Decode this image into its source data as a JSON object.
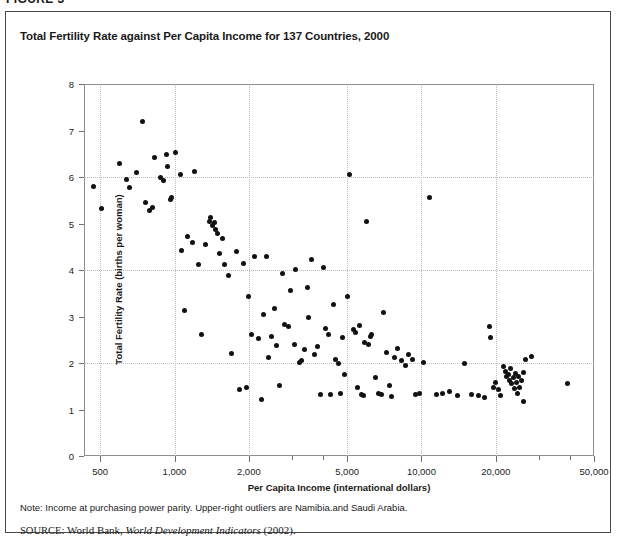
{
  "figure": {
    "label": "FIGURE 3",
    "title": "Total Fertility Rate against Per Capita Income for 137 Countries, 2000",
    "note": "Note: Income at purchasing power parity. Upper-right outliers are Namibia.and Saudi Arabia.",
    "source_keyword": "SOURCE:",
    "source_text": "World Bank,",
    "source_italic": "World Development Indicators",
    "source_year": "(2002)."
  },
  "chart_data": {
    "type": "scatter",
    "title": "Total Fertility Rate against Per Capita Income for 137 Countries, 2000",
    "xlabel": "Per Capita Income (international dollars)",
    "ylabel": "Total Fertility Rate (births per woman)",
    "xscale": "log",
    "xlim": [
      430,
      50000
    ],
    "ylim": [
      0,
      8
    ],
    "grid": true,
    "legend": null,
    "xticks": [
      500,
      1000,
      2000,
      5000,
      10000,
      20000,
      50000
    ],
    "xticklabels": [
      "500",
      "1,000",
      "2,000",
      "5,000",
      "10,000",
      "20,000",
      "50,000"
    ],
    "xminorticks": [
      3000,
      4000,
      30000,
      40000
    ],
    "yticks": [
      0,
      1,
      2,
      3,
      4,
      5,
      6,
      7,
      8
    ],
    "yticklabels": [
      "0",
      "1",
      "2",
      "3",
      "4",
      "5",
      "6",
      "7",
      "8"
    ],
    "ygridlines": [
      2,
      4,
      6
    ],
    "n_points": 137,
    "annotations": [
      "Upper-right outliers are Namibia and Saudi Arabia"
    ],
    "points": [
      [
        470,
        5.8
      ],
      [
        505,
        5.32
      ],
      [
        600,
        6.3
      ],
      [
        640,
        5.95
      ],
      [
        700,
        6.1
      ],
      [
        660,
        5.78
      ],
      [
        745,
        7.2
      ],
      [
        760,
        5.45
      ],
      [
        790,
        5.28
      ],
      [
        815,
        5.35
      ],
      [
        830,
        6.42
      ],
      [
        880,
        6.0
      ],
      [
        905,
        5.92
      ],
      [
        930,
        6.48
      ],
      [
        940,
        6.22
      ],
      [
        960,
        5.52
      ],
      [
        975,
        5.55
      ],
      [
        1010,
        6.52
      ],
      [
        1060,
        6.05
      ],
      [
        1070,
        4.42
      ],
      [
        1100,
        3.12
      ],
      [
        1130,
        4.72
      ],
      [
        1180,
        4.6
      ],
      [
        1210,
        6.12
      ],
      [
        1250,
        4.12
      ],
      [
        1290,
        2.62
      ],
      [
        1330,
        4.55
      ],
      [
        1380,
        5.05
      ],
      [
        1400,
        5.12
      ],
      [
        1430,
        4.95
      ],
      [
        1450,
        5.02
      ],
      [
        1470,
        4.88
      ],
      [
        1500,
        4.78
      ],
      [
        1520,
        4.35
      ],
      [
        1560,
        4.68
      ],
      [
        1600,
        4.12
      ],
      [
        1650,
        3.88
      ],
      [
        1700,
        2.2
      ],
      [
        1780,
        4.4
      ],
      [
        1830,
        1.42
      ],
      [
        1900,
        4.15
      ],
      [
        1950,
        1.48
      ],
      [
        2000,
        3.42
      ],
      [
        2050,
        2.62
      ],
      [
        2100,
        4.28
      ],
      [
        2180,
        2.52
      ],
      [
        2250,
        1.22
      ],
      [
        2300,
        3.05
      ],
      [
        2350,
        4.3
      ],
      [
        2400,
        2.12
      ],
      [
        2480,
        2.58
      ],
      [
        2550,
        3.18
      ],
      [
        2600,
        2.38
      ],
      [
        2650,
        1.52
      ],
      [
        2750,
        3.92
      ],
      [
        2800,
        2.82
      ],
      [
        2900,
        2.78
      ],
      [
        2950,
        3.55
      ],
      [
        3050,
        2.4
      ],
      [
        3100,
        4.02
      ],
      [
        3200,
        2.02
      ],
      [
        3280,
        2.05
      ],
      [
        3350,
        2.3
      ],
      [
        3450,
        3.62
      ],
      [
        3500,
        2.98
      ],
      [
        3600,
        4.22
      ],
      [
        3700,
        2.18
      ],
      [
        3800,
        2.35
      ],
      [
        3900,
        1.32
      ],
      [
        4000,
        4.05
      ],
      [
        4100,
        2.75
      ],
      [
        4200,
        2.62
      ],
      [
        4300,
        1.32
      ],
      [
        4400,
        3.25
      ],
      [
        4500,
        2.08
      ],
      [
        4600,
        1.98
      ],
      [
        4700,
        1.35
      ],
      [
        4800,
        2.55
      ],
      [
        4900,
        1.75
      ],
      [
        5000,
        3.42
      ],
      [
        5100,
        6.05
      ],
      [
        5300,
        2.72
      ],
      [
        5400,
        2.65
      ],
      [
        5500,
        1.48
      ],
      [
        5600,
        2.8
      ],
      [
        5700,
        1.32
      ],
      [
        5800,
        1.3
      ],
      [
        5900,
        2.45
      ],
      [
        6000,
        5.05
      ],
      [
        6100,
        2.4
      ],
      [
        6200,
        2.58
      ],
      [
        6300,
        2.62
      ],
      [
        6500,
        1.68
      ],
      [
        6700,
        1.35
      ],
      [
        6900,
        1.32
      ],
      [
        7000,
        3.08
      ],
      [
        7200,
        2.22
      ],
      [
        7400,
        1.52
      ],
      [
        7600,
        1.28
      ],
      [
        7800,
        2.12
      ],
      [
        8000,
        2.32
      ],
      [
        8300,
        2.05
      ],
      [
        8600,
        1.95
      ],
      [
        8900,
        2.18
      ],
      [
        9200,
        2.08
      ],
      [
        9500,
        1.32
      ],
      [
        9800,
        1.35
      ],
      [
        10200,
        2.02
      ],
      [
        10800,
        5.55
      ],
      [
        11500,
        1.32
      ],
      [
        12200,
        1.35
      ],
      [
        13000,
        1.38
      ],
      [
        14000,
        1.3
      ],
      [
        15000,
        2.0
      ],
      [
        16000,
        1.32
      ],
      [
        17000,
        1.3
      ],
      [
        18000,
        1.25
      ],
      [
        18800,
        2.78
      ],
      [
        19000,
        2.55
      ],
      [
        19500,
        1.48
      ],
      [
        20000,
        1.58
      ],
      [
        20500,
        1.42
      ],
      [
        21000,
        1.3
      ],
      [
        21500,
        1.92
      ],
      [
        22000,
        1.82
      ],
      [
        22200,
        1.72
      ],
      [
        22500,
        1.75
      ],
      [
        22800,
        1.62
      ],
      [
        23000,
        1.88
      ],
      [
        23200,
        1.55
      ],
      [
        23500,
        1.68
      ],
      [
        23800,
        1.45
      ],
      [
        24000,
        1.78
      ],
      [
        24200,
        1.58
      ],
      [
        24500,
        1.35
      ],
      [
        24800,
        1.7
      ],
      [
        25000,
        1.48
      ],
      [
        25500,
        1.62
      ],
      [
        25800,
        1.18
      ],
      [
        26000,
        1.8
      ],
      [
        26500,
        2.08
      ],
      [
        28000,
        2.15
      ],
      [
        39000,
        1.55
      ]
    ]
  }
}
